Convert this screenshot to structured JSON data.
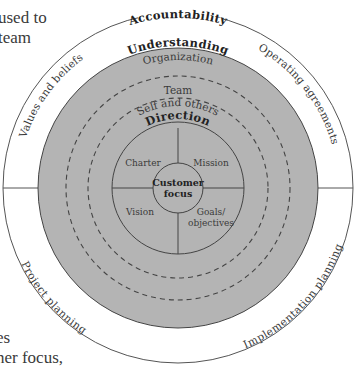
{
  "cropped_text": {
    "top_lines": [
      "used to",
      "team"
    ],
    "bottom_lines": [
      "es",
      "ner focus,"
    ]
  },
  "diagram": {
    "outer_ring": {
      "title": "Accountability",
      "quadrants": {
        "top_left": "Values and beliefs",
        "top_right": "Operating agreements",
        "bottom_left": "Project planning",
        "bottom_right": "Implementation planning"
      }
    },
    "understanding": {
      "title": "Understanding",
      "levels": [
        "Organization",
        "Team",
        "Self and others"
      ]
    },
    "direction": {
      "title": "Direction",
      "quadrants": {
        "top_left": "Charter",
        "top_right": "Mission",
        "bottom_left": "Vision",
        "bottom_right_line1": "Goals/",
        "bottom_right_line2": "objectives"
      }
    },
    "center": {
      "line1": "Customer",
      "line2": "focus"
    },
    "colors": {
      "fill_gray": "#b4b4b4",
      "line": "#444444",
      "background": "#ffffff"
    }
  }
}
